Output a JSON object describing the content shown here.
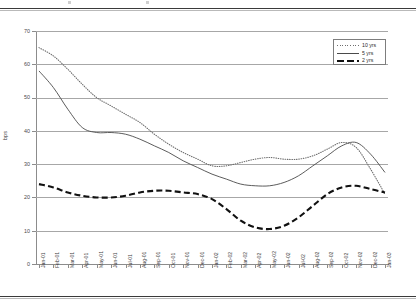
{
  "chart_data": {
    "type": "line",
    "title": "",
    "xlabel": "",
    "ylabel": "bps",
    "ylim": [
      0,
      70
    ],
    "ytick_step": 10,
    "ytick_labels": [
      "70",
      "60",
      "50",
      "40",
      "30",
      "20",
      "10",
      "0"
    ],
    "grid": true,
    "legend_position": "top-right",
    "categories": [
      "Jan-01",
      "Feb-01",
      "Mar-01",
      "Apr-01",
      "May-01",
      "Jun-01",
      "Jul-01",
      "Aug-01",
      "Sep-01",
      "Oct-01",
      "Nov-01",
      "Dec-01",
      "Jan-02",
      "Feb-02",
      "Mar-02",
      "Apr-02",
      "May-02",
      "Jun-02",
      "Jul-02",
      "Aug-02",
      "Sep-02",
      "Oct-02",
      "Nov-02",
      "Dec-02",
      "Jan-03"
    ],
    "series": [
      {
        "name": "10 yrs",
        "style": "dotted",
        "color": "#6e6e6e",
        "values": [
          65,
          62.5,
          58.5,
          54,
          50,
          47.5,
          45,
          42.5,
          39,
          36,
          33.5,
          31.5,
          29.5,
          29.5,
          30.5,
          31.5,
          32,
          31.5,
          31.5,
          32.5,
          34.5,
          36.5,
          35,
          28.5,
          21
        ]
      },
      {
        "name": "5 yrs",
        "style": "solid",
        "color": "#4a4a4a",
        "values": [
          58,
          53,
          46.5,
          41,
          39.5,
          39.5,
          39,
          37.5,
          35.5,
          33.5,
          31,
          29,
          27,
          25.5,
          24,
          23.5,
          23.5,
          24.5,
          26.5,
          29.5,
          32.5,
          35.5,
          36.5,
          33,
          27.5
        ]
      },
      {
        "name": "2 yrs",
        "style": "dashed",
        "color": "#111111",
        "values": [
          24,
          23,
          21.5,
          20.5,
          20,
          20,
          20.5,
          21.5,
          22,
          22,
          21.5,
          21,
          19.5,
          16.5,
          13,
          11,
          10.5,
          11.5,
          14,
          17.5,
          21,
          23,
          23.5,
          22.5,
          21.5
        ]
      }
    ],
    "legend": [
      {
        "label": "10 yrs",
        "swatch": "dotted-line-swatch"
      },
      {
        "label": "5 yrs",
        "swatch": "solid-line-swatch"
      },
      {
        "label": "2 yrs",
        "swatch": "dashed-line-swatch"
      }
    ]
  }
}
